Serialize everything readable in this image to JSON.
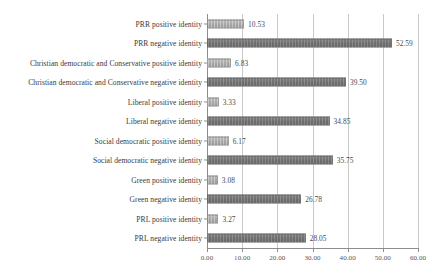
{
  "chart_data": {
    "type": "bar",
    "orientation": "horizontal",
    "title": "",
    "subtitle": "",
    "xlabel": "",
    "ylabel": "",
    "xlim": [
      0,
      60
    ],
    "xticks": [
      "0.00",
      "10.00",
      "20.00",
      "30.00",
      "40.00",
      "50.00",
      "60.00"
    ],
    "xtick_values": [
      0,
      10,
      20,
      30,
      40,
      50,
      60
    ],
    "grid": true,
    "legend": "none",
    "value_label_format": "2 decimals",
    "categories": [
      "PRR positive identity",
      "PRR negative identity",
      "Christian democratic and Conservative positive identity",
      "Christian democratic and Conservative negative identity",
      "Liberal positive identity",
      "Liberal negative identity",
      "Social democratic positive identity",
      "Social democratic negative identity",
      "Green positive identity",
      "Green negative identity",
      "PRL positive identity",
      "PRL negative identity"
    ],
    "values": [
      10.53,
      52.59,
      6.83,
      39.5,
      3.33,
      34.85,
      6.17,
      35.75,
      3.08,
      26.78,
      3.27,
      28.05
    ],
    "value_labels": [
      "10.53",
      "52.59",
      "6.83",
      "39.50",
      "3.33",
      "34.85",
      "6.17",
      "35.75",
      "3.08",
      "26.78",
      "3.27",
      "28.05"
    ],
    "series_kinds": [
      "positive",
      "negative",
      "positive",
      "negative",
      "positive",
      "negative",
      "positive",
      "negative",
      "positive",
      "negative",
      "positive",
      "negative"
    ],
    "colors": {
      "positive_bar": "#a6a6a6",
      "negative_bar": "#6e6e6e",
      "gridline": "#c9c9c9",
      "axis": "#8d8d8d",
      "text": "#3a3a3a",
      "background": "#ffffff"
    }
  }
}
